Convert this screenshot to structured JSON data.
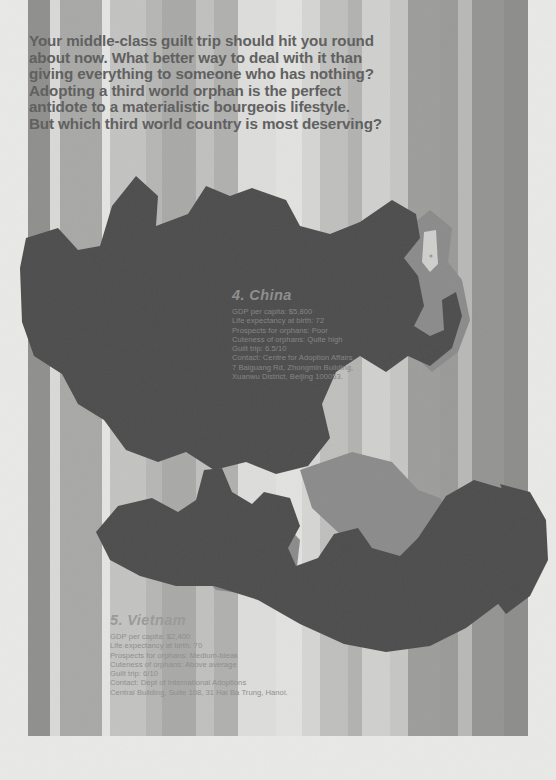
{
  "headline": {
    "lines": [
      "Your middle-class guilt trip should hit you round",
      "about now. What better way to deal with it than",
      "giving everything to someone who has nothing?",
      "Adopting a third world orphan is the perfect",
      "antidote to a materialistic bourgeois lifestyle.",
      "But which third world country is most deserving?"
    ]
  },
  "entries": [
    {
      "id": "china",
      "title": "4. China",
      "lines": [
        "GDP per capita: $5,800",
        "Life expectancy at birth: 72",
        "Prospects for orphans: Poor",
        "Cuteness of orphans: Quite high",
        "Guilt trip: 6.5/10",
        "Contact: Centre for Adoption Affairs",
        "7 Baiguang Rd, Zhongmin Building,",
        "Xuanwu District, Beijing 100053."
      ]
    },
    {
      "id": "vietnam",
      "title": "5. Vietnam",
      "lines": [
        "GDP per capita: $2,400",
        "Life expectancy at birth: 70",
        "Prospects for orphans: Medium-bleak",
        "Cuteness of orphans: Above average",
        "Guilt trip: 6/10",
        "Contact: Dept of International Adoptions",
        "Central Building, Suite 108, 31 Hai Ba Trung, Hanoi."
      ]
    }
  ],
  "palette": {
    "paper": "#e9e9e7",
    "landmass_dark": "#4d4d4d",
    "landmass_mid": "#8b8b8b",
    "headline_text": "#5e5e5e"
  },
  "stripes": [
    {
      "x": 28,
      "w": 22,
      "color": "#8f8f8d"
    },
    {
      "x": 50,
      "w": 10,
      "color": "#d9d9d7"
    },
    {
      "x": 60,
      "w": 42,
      "color": "#a8a8a6"
    },
    {
      "x": 102,
      "w": 8,
      "color": "#e4e4e2"
    },
    {
      "x": 110,
      "w": 36,
      "color": "#c3c3c1"
    },
    {
      "x": 146,
      "w": 16,
      "color": "#b6b6b4"
    },
    {
      "x": 162,
      "w": 34,
      "color": "#a9a9a7"
    },
    {
      "x": 196,
      "w": 18,
      "color": "#c0c0be"
    },
    {
      "x": 214,
      "w": 24,
      "color": "#b0b0ae"
    },
    {
      "x": 238,
      "w": 38,
      "color": "#dddddb"
    },
    {
      "x": 276,
      "w": 26,
      "color": "#e2e2e0"
    },
    {
      "x": 302,
      "w": 18,
      "color": "#d5d5d3"
    },
    {
      "x": 320,
      "w": 28,
      "color": "#bfbfbd"
    },
    {
      "x": 348,
      "w": 14,
      "color": "#b2b2b0"
    },
    {
      "x": 362,
      "w": 28,
      "color": "#d0d0ce"
    },
    {
      "x": 390,
      "w": 18,
      "color": "#c6c6c4"
    },
    {
      "x": 408,
      "w": 32,
      "color": "#9d9d9b"
    },
    {
      "x": 440,
      "w": 18,
      "color": "#9a9a98"
    },
    {
      "x": 458,
      "w": 14,
      "color": "#b8b8b6"
    },
    {
      "x": 472,
      "w": 32,
      "color": "#949492"
    },
    {
      "x": 504,
      "w": 24,
      "color": "#8d8d8b"
    }
  ]
}
